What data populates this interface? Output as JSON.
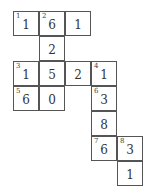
{
  "puzzle": {
    "cell_size": 26,
    "row_height": 25,
    "cells": [
      {
        "row": 0,
        "col": 0,
        "clue": "1",
        "value": "1"
      },
      {
        "row": 0,
        "col": 1,
        "clue": "2",
        "value": "6"
      },
      {
        "row": 0,
        "col": 2,
        "clue": "",
        "value": "1"
      },
      {
        "row": 1,
        "col": 1,
        "clue": "",
        "value": "2"
      },
      {
        "row": 2,
        "col": 0,
        "clue": "3",
        "value": "1"
      },
      {
        "row": 2,
        "col": 1,
        "clue": "",
        "value": "5"
      },
      {
        "row": 2,
        "col": 2,
        "clue": "",
        "value": "2"
      },
      {
        "row": 2,
        "col": 3,
        "clue": "4",
        "value": "1"
      },
      {
        "row": 3,
        "col": 0,
        "clue": "5",
        "value": "6"
      },
      {
        "row": 3,
        "col": 1,
        "clue": "",
        "value": "0"
      },
      {
        "row": 3,
        "col": 3,
        "clue": "6",
        "value": "3"
      },
      {
        "row": 4,
        "col": 3,
        "clue": "",
        "value": "8"
      },
      {
        "row": 5,
        "col": 3,
        "clue": "7",
        "value": "6"
      },
      {
        "row": 5,
        "col": 4,
        "clue": "8",
        "value": "3"
      },
      {
        "row": 6,
        "col": 4,
        "clue": "",
        "value": "1"
      }
    ]
  }
}
